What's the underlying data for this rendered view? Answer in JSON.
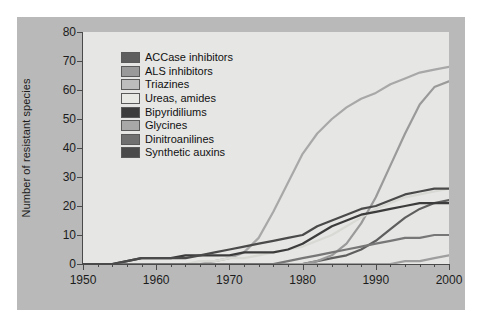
{
  "chart_data": {
    "type": "line",
    "title": "",
    "xlabel": "",
    "ylabel": "Number of resistant species",
    "xlim": [
      1950,
      2000
    ],
    "ylim": [
      0,
      80
    ],
    "xticks": [
      1950,
      1960,
      1970,
      1980,
      1990,
      2000
    ],
    "yticks": [
      0,
      10,
      20,
      30,
      40,
      50,
      60,
      70,
      80
    ],
    "xtick_labels": [
      "1950",
      "1960",
      "1970",
      "1980",
      "1990",
      "2000"
    ],
    "ytick_labels": [
      "0",
      "10",
      "20",
      "30",
      "40",
      "50",
      "60",
      "70",
      "80"
    ],
    "minor_ticks": "every 2 years on x-axis",
    "grid": false,
    "legend_position": "upper left inside plot",
    "x": [
      1950,
      1952,
      1954,
      1956,
      1958,
      1960,
      1962,
      1964,
      1966,
      1968,
      1970,
      1972,
      1974,
      1976,
      1978,
      1980,
      1982,
      1984,
      1986,
      1988,
      1990,
      1992,
      1994,
      1996,
      1998,
      2000
    ],
    "series": [
      {
        "name": "ACCase inhibitors",
        "color": "#5e5e5e",
        "values": [
          0,
          0,
          0,
          0,
          0,
          0,
          0,
          0,
          0,
          0,
          0,
          0,
          0,
          0,
          0,
          0,
          1,
          2,
          3,
          5,
          8,
          12,
          16,
          19,
          21,
          22
        ]
      },
      {
        "name": "ALS inhibitors",
        "color": "#9a9a9a",
        "values": [
          0,
          0,
          0,
          0,
          0,
          0,
          0,
          0,
          0,
          0,
          0,
          0,
          0,
          0,
          0,
          0,
          1,
          3,
          7,
          14,
          23,
          34,
          45,
          55,
          61,
          63
        ]
      },
      {
        "name": "Triazines",
        "color": "#a8a8a8",
        "values": [
          0,
          0,
          0,
          0,
          0,
          0,
          0,
          0,
          0,
          1,
          2,
          4,
          9,
          18,
          28,
          38,
          45,
          50,
          54,
          57,
          59,
          62,
          64,
          66,
          67,
          68
        ]
      },
      {
        "name": "Ureas, amides",
        "color": "#d8d8d4",
        "values": [
          0,
          0,
          0,
          0,
          0,
          0,
          0,
          0,
          1,
          1,
          2,
          2,
          3,
          4,
          5,
          6,
          8,
          10,
          13,
          16,
          19,
          21,
          23,
          24,
          25,
          26
        ]
      },
      {
        "name": "Bipyridiliums",
        "color": "#3c3c3c",
        "values": [
          0,
          0,
          0,
          1,
          2,
          2,
          2,
          3,
          3,
          3,
          3,
          4,
          4,
          4,
          5,
          7,
          10,
          13,
          15,
          17,
          18,
          19,
          20,
          21,
          21,
          21
        ]
      },
      {
        "name": "Glycines",
        "color": "#9e9e9e",
        "values": [
          0,
          0,
          0,
          0,
          0,
          0,
          0,
          0,
          0,
          0,
          0,
          0,
          0,
          0,
          0,
          0,
          0,
          0,
          0,
          0,
          0,
          0,
          1,
          1,
          2,
          3
        ]
      },
      {
        "name": "Dinitroanilines",
        "color": "#777777",
        "values": [
          0,
          0,
          0,
          0,
          0,
          0,
          0,
          0,
          0,
          0,
          0,
          0,
          0,
          0,
          1,
          2,
          3,
          4,
          5,
          6,
          7,
          8,
          9,
          9,
          10,
          10
        ]
      },
      {
        "name": "Synthetic auxins",
        "color": "#4a4a4a",
        "values": [
          0,
          0,
          0,
          1,
          2,
          2,
          2,
          2,
          3,
          4,
          5,
          6,
          7,
          8,
          9,
          10,
          13,
          15,
          17,
          19,
          20,
          22,
          24,
          25,
          26,
          26
        ]
      }
    ]
  },
  "legend": {
    "entries": [
      {
        "label": "ACCase inhibitors",
        "swatch": "#5e5e5e"
      },
      {
        "label": "ALS inhibitors",
        "swatch": "#9a9a9a"
      },
      {
        "label": "Triazines",
        "swatch": "#bdbdbd"
      },
      {
        "label": "Ureas, amides",
        "swatch": "#e8e8e4"
      },
      {
        "label": "Bipyridiliums",
        "swatch": "#3c3c3c"
      },
      {
        "label": "Glycines",
        "swatch": "#a8a8a8"
      },
      {
        "label": "Dinitroanilines",
        "swatch": "#707070"
      },
      {
        "label": "Synthetic auxins",
        "swatch": "#4a4a4a"
      }
    ]
  }
}
